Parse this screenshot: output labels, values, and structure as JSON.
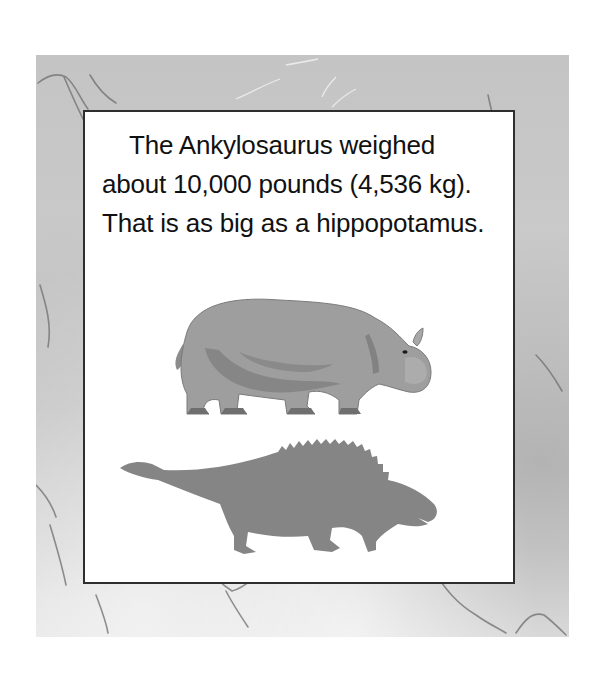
{
  "page": {
    "text_lines": [
      "The Ankylosaurus weighed",
      "about 10,000 pounds (4,536 kg).",
      "That is as big as a hippopotamus."
    ],
    "illustrations": {
      "top": "hippopotamus",
      "bottom": "ankylosaurus-silhouette"
    },
    "colors": {
      "frame_stone": "#c8c8c8",
      "box_border": "#2e2e2e",
      "text": "#111111",
      "hippo_body": "#9a9a9a",
      "hippo_shadow": "#7d7d7d",
      "ankylo_silhouette": "#858585"
    }
  }
}
